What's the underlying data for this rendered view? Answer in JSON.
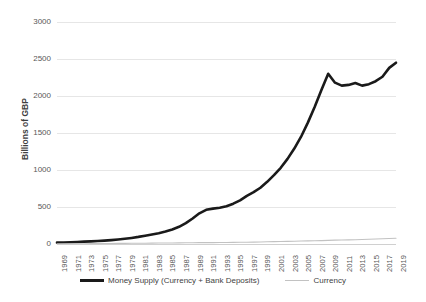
{
  "chart_data": {
    "type": "line",
    "title": "",
    "xlabel": "",
    "ylabel": "Billions of GBP",
    "xlim": [
      1969,
      2019
    ],
    "ylim": [
      0,
      3000
    ],
    "ytick_labels": [
      "3000",
      "2500",
      "2000",
      "1500",
      "1000",
      "500",
      "0"
    ],
    "ytick_values": [
      3000,
      2500,
      2000,
      1500,
      1000,
      500,
      0
    ],
    "xtick_labels": [
      "1969",
      "1971",
      "1973",
      "1975",
      "1977",
      "1979",
      "1981",
      "1983",
      "1985",
      "1987",
      "1989",
      "1991",
      "1993",
      "1995",
      "1997",
      "1999",
      "2001",
      "2003",
      "2005",
      "2007",
      "2009",
      "2011",
      "2013",
      "2015",
      "2017",
      "2019"
    ],
    "grid": true,
    "legend_position": "bottom",
    "x": [
      1969,
      1970,
      1971,
      1972,
      1973,
      1974,
      1975,
      1976,
      1977,
      1978,
      1979,
      1980,
      1981,
      1982,
      1983,
      1984,
      1985,
      1986,
      1987,
      1988,
      1989,
      1990,
      1991,
      1992,
      1993,
      1994,
      1995,
      1996,
      1997,
      1998,
      1999,
      2000,
      2001,
      2002,
      2003,
      2004,
      2005,
      2006,
      2007,
      2008,
      2009,
      2010,
      2011,
      2012,
      2013,
      2014,
      2015,
      2016,
      2017,
      2018,
      2019
    ],
    "series": [
      {
        "name": "Money Supply (Currency + Bank Deposits)",
        "color": "#1a1a1a",
        "width": 2.6,
        "values": [
          18,
          20,
          23,
          27,
          32,
          36,
          41,
          46,
          52,
          60,
          70,
          82,
          96,
          112,
          128,
          146,
          168,
          196,
          232,
          282,
          345,
          415,
          462,
          478,
          490,
          510,
          545,
          590,
          650,
          700,
          760,
          840,
          930,
          1030,
          1150,
          1290,
          1450,
          1640,
          1850,
          2080,
          2300,
          2180,
          2140,
          2150,
          2175,
          2140,
          2160,
          2200,
          2260,
          2380,
          2450
        ]
      },
      {
        "name": "Currency",
        "color": "#c2c2c2",
        "width": 1.1,
        "values": [
          3,
          3,
          3,
          4,
          4,
          5,
          5,
          6,
          7,
          8,
          9,
          10,
          10,
          11,
          12,
          13,
          14,
          14,
          15,
          16,
          17,
          18,
          18,
          19,
          20,
          21,
          22,
          23,
          24,
          26,
          28,
          30,
          32,
          34,
          36,
          38,
          40,
          42,
          44,
          46,
          49,
          52,
          54,
          56,
          58,
          61,
          64,
          67,
          70,
          74,
          78
        ]
      }
    ]
  },
  "legend": {
    "entries": [
      {
        "label": "Money Supply (Currency + Bank Deposits)",
        "swatch": "thick-black-line"
      },
      {
        "label": "Currency",
        "swatch": "thin-gray-line"
      }
    ]
  },
  "colors": {
    "money_supply": "#1a1a1a",
    "currency": "#c2c2c2",
    "gridline": "#e6e6e6",
    "tick_text": "#585858",
    "axis_title": "#3f3f3f",
    "background": "#ffffff"
  }
}
